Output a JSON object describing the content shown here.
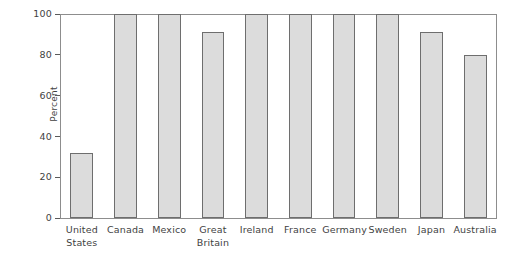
{
  "chart_data": {
    "type": "bar",
    "title": "",
    "subtitle": "",
    "xlabel": "",
    "ylabel": "Percent",
    "ylim": [
      0,
      100
    ],
    "ytick_values": [
      0,
      20,
      40,
      60,
      80,
      100
    ],
    "ytick_labels": [
      "0",
      "20",
      "40",
      "60",
      "80",
      "100"
    ],
    "grid": false,
    "legend": null,
    "categories": [
      "United States",
      "Canada",
      "Mexico",
      "Great Britain",
      "Ireland",
      "France",
      "Germany",
      "Sweden",
      "Japan",
      "Australia"
    ],
    "category_lines": [
      [
        "United",
        "States"
      ],
      [
        "Canada"
      ],
      [
        "Mexico"
      ],
      [
        "Great",
        "Britain"
      ],
      [
        "Ireland"
      ],
      [
        "France"
      ],
      [
        "Germany"
      ],
      [
        "Sweden"
      ],
      [
        "Japan"
      ],
      [
        "Australia"
      ]
    ],
    "values": [
      32,
      100,
      100,
      91,
      100,
      100,
      100,
      100,
      91,
      80
    ],
    "bar_fill_color": "#dcdcdc",
    "bar_edge_color": "#6e6e6e",
    "axis_color": "#8d8d8d",
    "text_color": "#3f3f3f",
    "background_color": "#ffffff"
  }
}
